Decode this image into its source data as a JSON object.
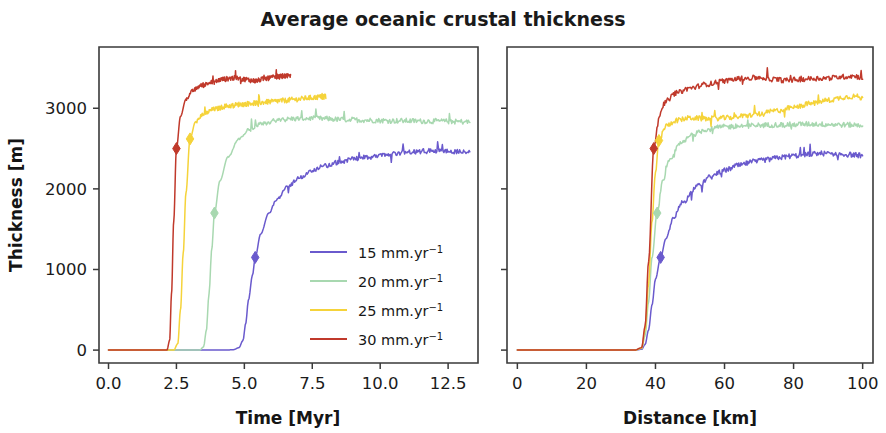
{
  "chart_data": [
    {
      "type": "line",
      "panel": "left",
      "title": "Average oceanic crustal thickness",
      "xlabel": "Time [Myr]",
      "ylabel": "Thickness [m]",
      "xlim": [
        -0.35,
        13.6
      ],
      "ylim": [
        -160,
        3760
      ],
      "xticks": [
        0.0,
        2.5,
        5.0,
        7.5,
        10.0,
        12.5
      ],
      "xtick_labels": [
        "0.0",
        "2.5",
        "5.0",
        "7.5",
        "10.0",
        "12.5"
      ],
      "yticks": [
        0,
        1000,
        2000,
        3000
      ],
      "ytick_labels": [
        "0",
        "1000",
        "2000",
        "3000"
      ],
      "grid": false,
      "legend_position": "center-right-inside",
      "series": [
        {
          "name": "15 mm.yr-1",
          "color": "#6a5acd",
          "marker": "diamond",
          "marker_point": {
            "x": 5.4,
            "y": 1150
          },
          "x": [
            0.0,
            1.0,
            2.0,
            3.0,
            3.8,
            4.3,
            4.6,
            4.8,
            4.95,
            5.05,
            5.15,
            5.3,
            5.4,
            5.6,
            5.9,
            6.2,
            6.6,
            7.0,
            7.5,
            8.0,
            8.5,
            9.0,
            9.5,
            10.0,
            10.5,
            11.0,
            11.5,
            12.0,
            12.5,
            13.0,
            13.3
          ],
          "y": [
            0,
            0,
            0,
            0,
            0,
            0,
            5,
            30,
            120,
            330,
            620,
            930,
            1150,
            1440,
            1700,
            1870,
            2030,
            2130,
            2230,
            2290,
            2330,
            2370,
            2390,
            2410,
            2430,
            2450,
            2465,
            2475,
            2470,
            2460,
            2455
          ]
        },
        {
          "name": "20 mm.yr-1",
          "color": "#a8d8b0",
          "marker": "diamond",
          "marker_point": {
            "x": 3.9,
            "y": 1700
          },
          "x": [
            0.0,
            1.0,
            2.0,
            3.0,
            3.35,
            3.5,
            3.6,
            3.7,
            3.8,
            3.9,
            4.1,
            4.4,
            4.8,
            5.2,
            5.7,
            6.2,
            6.8,
            7.4,
            8.0,
            8.6,
            9.2,
            9.8,
            10.4,
            11.0,
            11.6,
            12.2,
            12.8,
            13.3
          ],
          "y": [
            0,
            0,
            0,
            0,
            0,
            40,
            240,
            700,
            1250,
            1700,
            2100,
            2400,
            2620,
            2740,
            2810,
            2850,
            2870,
            2875,
            2870,
            2860,
            2855,
            2850,
            2845,
            2845,
            2840,
            2840,
            2835,
            2830
          ]
        },
        {
          "name": "25 mm.yr-1",
          "color": "#f5d33a",
          "marker": "diamond",
          "marker_point": {
            "x": 3.0,
            "y": 2620
          },
          "x": [
            0.0,
            1.0,
            2.0,
            2.4,
            2.55,
            2.65,
            2.75,
            2.85,
            3.0,
            3.2,
            3.5,
            3.9,
            4.4,
            4.9,
            5.4,
            5.9,
            6.4,
            6.9,
            7.4,
            7.8,
            8.0
          ],
          "y": [
            0,
            0,
            0,
            0,
            80,
            500,
            1200,
            1950,
            2620,
            2830,
            2930,
            2990,
            3030,
            3050,
            3065,
            3080,
            3095,
            3110,
            3130,
            3140,
            3145
          ]
        },
        {
          "name": "30 mm.yr-1",
          "color": "#c0392b",
          "marker": "diamond",
          "marker_point": {
            "x": 2.5,
            "y": 2500
          },
          "x": [
            0.0,
            1.0,
            1.8,
            2.15,
            2.25,
            2.32,
            2.4,
            2.5,
            2.65,
            2.85,
            3.1,
            3.4,
            3.8,
            4.2,
            4.6,
            5.0,
            5.4,
            5.8,
            6.2,
            6.5,
            6.7
          ],
          "y": [
            0,
            0,
            0,
            0,
            120,
            700,
            1600,
            2500,
            2900,
            3110,
            3220,
            3280,
            3320,
            3360,
            3375,
            3360,
            3340,
            3370,
            3390,
            3400,
            3395
          ]
        }
      ]
    },
    {
      "type": "line",
      "panel": "right",
      "xlabel": "Distance [km]",
      "ylabel": "",
      "xlim": [
        -3,
        103
      ],
      "ylim": [
        -160,
        3760
      ],
      "xticks": [
        0,
        20,
        40,
        60,
        80,
        100
      ],
      "xtick_labels": [
        "0",
        "20",
        "40",
        "60",
        "80",
        "100"
      ],
      "yticks": [
        0,
        1000,
        2000,
        3000
      ],
      "ytick_labels": [
        "",
        "",
        "",
        ""
      ],
      "grid": false,
      "series": [
        {
          "name": "15 mm.yr-1",
          "color": "#6a5acd",
          "marker": "diamond",
          "marker_point": {
            "x": 41.5,
            "y": 1150
          },
          "x": [
            0,
            10,
            20,
            30,
            34,
            36,
            37,
            38,
            39,
            40,
            41.5,
            43,
            45,
            48,
            52,
            56,
            60,
            64,
            68,
            72,
            76,
            80,
            84,
            88,
            92,
            96,
            100
          ],
          "y": [
            0,
            0,
            0,
            0,
            0,
            10,
            70,
            250,
            560,
            880,
            1150,
            1380,
            1620,
            1840,
            2030,
            2150,
            2230,
            2290,
            2330,
            2360,
            2390,
            2410,
            2430,
            2440,
            2435,
            2425,
            2415
          ]
        },
        {
          "name": "20 mm.yr-1",
          "color": "#a8d8b0",
          "marker": "diamond",
          "marker_point": {
            "x": 40.5,
            "y": 1700
          },
          "x": [
            0,
            10,
            20,
            30,
            34,
            36,
            37,
            38,
            39,
            40.5,
            42,
            44,
            47,
            51,
            55,
            60,
            65,
            70,
            75,
            80,
            85,
            90,
            95,
            100
          ],
          "y": [
            0,
            0,
            0,
            0,
            0,
            20,
            180,
            600,
            1150,
            1700,
            2080,
            2340,
            2550,
            2680,
            2740,
            2770,
            2780,
            2790,
            2795,
            2800,
            2805,
            2800,
            2795,
            2790
          ]
        },
        {
          "name": "25 mm.yr-1",
          "color": "#f5d33a",
          "marker": "diamond",
          "marker_point": {
            "x": 41,
            "y": 2600
          },
          "x": [
            0,
            10,
            20,
            30,
            34,
            36,
            37,
            38,
            39,
            40,
            41,
            43,
            46,
            50,
            55,
            60,
            65,
            70,
            75,
            80,
            85,
            90,
            95,
            98,
            100
          ],
          "y": [
            0,
            0,
            0,
            0,
            0,
            25,
            250,
            820,
            1600,
            2200,
            2600,
            2780,
            2850,
            2880,
            2870,
            2880,
            2900,
            2930,
            2970,
            3010,
            3060,
            3100,
            3140,
            3150,
            3120
          ]
        },
        {
          "name": "30 mm.yr-1",
          "color": "#c0392b",
          "marker": "diamond",
          "marker_point": {
            "x": 39.5,
            "y": 2500
          },
          "x": [
            0,
            10,
            20,
            30,
            34,
            36,
            37,
            38,
            39.5,
            41,
            43,
            46,
            50,
            55,
            60,
            65,
            70,
            74,
            78,
            82,
            86,
            90,
            94,
            97,
            100
          ],
          "y": [
            0,
            0,
            0,
            0,
            0,
            30,
            300,
            1100,
            2500,
            2900,
            3090,
            3190,
            3250,
            3300,
            3340,
            3370,
            3380,
            3360,
            3345,
            3360,
            3370,
            3375,
            3390,
            3400,
            3385
          ]
        }
      ]
    }
  ],
  "title": "Average oceanic crustal thickness",
  "left_panel": {
    "xlabel": "Time [Myr]",
    "ylabel": "Thickness [m]",
    "xtick_labels": [
      "0.0",
      "2.5",
      "5.0",
      "7.5",
      "10.0",
      "12.5"
    ],
    "ytick_labels": [
      "3000",
      "2000",
      "1000",
      "0"
    ]
  },
  "right_panel": {
    "xlabel": "Distance [km]",
    "xtick_labels": [
      "0",
      "20",
      "40",
      "60",
      "80",
      "100"
    ]
  },
  "legend": {
    "items": [
      {
        "label": "15 mm.yr",
        "sup": "−1",
        "color": "#6a5acd"
      },
      {
        "label": "20 mm.yr",
        "sup": "−1",
        "color": "#a8d8b0"
      },
      {
        "label": "25 mm.yr",
        "sup": "−1",
        "color": "#f5d33a"
      },
      {
        "label": "30 mm.yr",
        "sup": "−1",
        "color": "#c0392b"
      }
    ]
  }
}
